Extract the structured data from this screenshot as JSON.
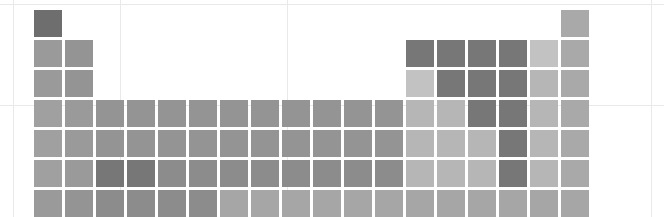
{
  "figure": {
    "type": "periodic-table-heatmap",
    "title": "",
    "background": "#ffffff",
    "cell_width": 28,
    "cell_height": 27,
    "cell_gap": 3,
    "grid_columns": 18,
    "grid_rows": 10,
    "origin": {
      "x": 34,
      "y": 10
    }
  },
  "guides": {
    "color": "#e9e9e9",
    "horizontal_y": [
      4,
      105
    ],
    "vertical_x": [
      13,
      120,
      287,
      651
    ]
  },
  "palette": {
    "darkest": "#6e6e6e",
    "dark": "#777777",
    "mid_dark": "#8c8c8c",
    "mid": "#999999",
    "mid_light": "#a3a3a3",
    "light": "#b4b4b4",
    "lightest": "#c4c4c4",
    "empty": "transparent"
  },
  "chart_data": {
    "type": "heatmap",
    "title": "",
    "xlabel": "",
    "ylabel": "",
    "grid": false,
    "legend": "none",
    "columns": 18,
    "rows": 10,
    "colorscale": [
      "#c4c4c4",
      "#b4b4b4",
      "#a3a3a3",
      "#999999",
      "#8c8c8c",
      "#777777",
      "#6e6e6e"
    ],
    "cells": [
      [
        {
          "symbol": "H",
          "color": "#6e6e6e"
        },
        null,
        null,
        null,
        null,
        null,
        null,
        null,
        null,
        null,
        null,
        null,
        null,
        null,
        null,
        null,
        null,
        {
          "symbol": "He",
          "color": "#a9a9a9"
        }
      ],
      [
        {
          "symbol": "Li",
          "color": "#9a9a9a"
        },
        {
          "symbol": "Be",
          "color": "#949494"
        },
        null,
        null,
        null,
        null,
        null,
        null,
        null,
        null,
        null,
        null,
        {
          "symbol": "B",
          "color": "#777777"
        },
        {
          "symbol": "C",
          "color": "#777777"
        },
        {
          "symbol": "N",
          "color": "#777777"
        },
        {
          "symbol": "O",
          "color": "#777777"
        },
        {
          "symbol": "F",
          "color": "#c2c2c2"
        },
        {
          "symbol": "Ne",
          "color": "#a9a9a9"
        }
      ],
      [
        {
          "symbol": "Na",
          "color": "#9a9a9a"
        },
        {
          "symbol": "Mg",
          "color": "#949494"
        },
        null,
        null,
        null,
        null,
        null,
        null,
        null,
        null,
        null,
        null,
        {
          "symbol": "Al",
          "color": "#c2c2c2"
        },
        {
          "symbol": "Si",
          "color": "#777777"
        },
        {
          "symbol": "P",
          "color": "#777777"
        },
        {
          "symbol": "S",
          "color": "#777777"
        },
        {
          "symbol": "Cl",
          "color": "#b6b6b6"
        },
        {
          "symbol": "Ar",
          "color": "#a9a9a9"
        }
      ],
      [
        {
          "symbol": "K",
          "color": "#a0a0a0"
        },
        {
          "symbol": "Ca",
          "color": "#9a9a9a"
        },
        {
          "symbol": "Sc",
          "color": "#949494"
        },
        {
          "symbol": "Ti",
          "color": "#949494"
        },
        {
          "symbol": "V",
          "color": "#949494"
        },
        {
          "symbol": "Cr",
          "color": "#949494"
        },
        {
          "symbol": "Mn",
          "color": "#949494"
        },
        {
          "symbol": "Fe",
          "color": "#949494"
        },
        {
          "symbol": "Co",
          "color": "#949494"
        },
        {
          "symbol": "Ni",
          "color": "#949494"
        },
        {
          "symbol": "Cu",
          "color": "#949494"
        },
        {
          "symbol": "Zn",
          "color": "#949494"
        },
        {
          "symbol": "Ga",
          "color": "#b6b6b6"
        },
        {
          "symbol": "Ge",
          "color": "#b6b6b6"
        },
        {
          "symbol": "As",
          "color": "#777777"
        },
        {
          "symbol": "Se",
          "color": "#777777"
        },
        {
          "symbol": "Br",
          "color": "#b6b6b6"
        },
        {
          "symbol": "Kr",
          "color": "#a9a9a9"
        }
      ],
      [
        {
          "symbol": "Rb",
          "color": "#a0a0a0"
        },
        {
          "symbol": "Sr",
          "color": "#9a9a9a"
        },
        {
          "symbol": "Y",
          "color": "#949494"
        },
        {
          "symbol": "Zr",
          "color": "#949494"
        },
        {
          "symbol": "Nb",
          "color": "#949494"
        },
        {
          "symbol": "Mo",
          "color": "#949494"
        },
        {
          "symbol": "Tc",
          "color": "#949494"
        },
        {
          "symbol": "Ru",
          "color": "#949494"
        },
        {
          "symbol": "Rh",
          "color": "#949494"
        },
        {
          "symbol": "Pd",
          "color": "#949494"
        },
        {
          "symbol": "Ag",
          "color": "#949494"
        },
        {
          "symbol": "Cd",
          "color": "#949494"
        },
        {
          "symbol": "In",
          "color": "#b6b6b6"
        },
        {
          "symbol": "Sn",
          "color": "#b6b6b6"
        },
        {
          "symbol": "Sb",
          "color": "#b6b6b6"
        },
        {
          "symbol": "Te",
          "color": "#777777"
        },
        {
          "symbol": "I",
          "color": "#b6b6b6"
        },
        {
          "symbol": "Xe",
          "color": "#a9a9a9"
        }
      ],
      [
        {
          "symbol": "Cs",
          "color": "#a0a0a0"
        },
        {
          "symbol": "Ba",
          "color": "#9a9a9a"
        },
        {
          "symbol": "La",
          "color": "#777777"
        },
        {
          "symbol": "Hf",
          "color": "#777777"
        },
        {
          "symbol": "Ta",
          "color": "#8c8c8c"
        },
        {
          "symbol": "W",
          "color": "#8c8c8c"
        },
        {
          "symbol": "Re",
          "color": "#8c8c8c"
        },
        {
          "symbol": "Os",
          "color": "#8c8c8c"
        },
        {
          "symbol": "Ir",
          "color": "#8c8c8c"
        },
        {
          "symbol": "Pt",
          "color": "#8c8c8c"
        },
        {
          "symbol": "Au",
          "color": "#8c8c8c"
        },
        {
          "symbol": "Hg",
          "color": "#8c8c8c"
        },
        {
          "symbol": "Tl",
          "color": "#b6b6b6"
        },
        {
          "symbol": "Pb",
          "color": "#b6b6b6"
        },
        {
          "symbol": "Bi",
          "color": "#b6b6b6"
        },
        {
          "symbol": "Po",
          "color": "#777777"
        },
        {
          "symbol": "At",
          "color": "#b6b6b6"
        },
        {
          "symbol": "Rn",
          "color": "#a9a9a9"
        }
      ],
      [
        {
          "symbol": "Fr",
          "color": "#9a9a9a"
        },
        {
          "symbol": "Ra",
          "color": "#949494"
        },
        {
          "symbol": "Ac",
          "color": "#8c8c8c"
        },
        {
          "symbol": "Rf",
          "color": "#8c8c8c"
        },
        {
          "symbol": "Db",
          "color": "#8c8c8c"
        },
        {
          "symbol": "Sg",
          "color": "#8c8c8c"
        },
        {
          "symbol": "Bh",
          "color": "#a6a6a6"
        },
        {
          "symbol": "Hs",
          "color": "#a6a6a6"
        },
        {
          "symbol": "Mt",
          "color": "#a6a6a6"
        },
        {
          "symbol": "Ds",
          "color": "#a6a6a6"
        },
        {
          "symbol": "Rg",
          "color": "#a6a6a6"
        },
        {
          "symbol": "Cn",
          "color": "#a6a6a6"
        },
        {
          "symbol": "Nh",
          "color": "#a6a6a6"
        },
        {
          "symbol": "Fl",
          "color": "#a6a6a6"
        },
        {
          "symbol": "Mc",
          "color": "#a6a6a6"
        },
        {
          "symbol": "Lv",
          "color": "#a6a6a6"
        },
        {
          "symbol": "Ts",
          "color": "#a6a6a6"
        },
        {
          "symbol": "Og",
          "color": "#a6a6a6"
        }
      ],
      [
        null,
        null,
        null,
        null,
        null,
        null,
        null,
        null,
        null,
        null,
        null,
        null,
        null,
        null,
        null,
        null,
        null,
        null
      ],
      [
        null,
        null,
        {
          "symbol": "Ce",
          "color": "#777777"
        },
        {
          "symbol": "Pr",
          "color": "#777777"
        },
        {
          "symbol": "Nd",
          "color": "#777777"
        },
        {
          "symbol": "Pm",
          "color": "#777777"
        },
        {
          "symbol": "Sm",
          "color": "#777777"
        },
        {
          "symbol": "Eu",
          "color": "#777777"
        },
        {
          "symbol": "Gd",
          "color": "#777777"
        },
        {
          "symbol": "Tb",
          "color": "#777777"
        },
        {
          "symbol": "Dy",
          "color": "#777777"
        },
        {
          "symbol": "Ho",
          "color": "#777777"
        },
        {
          "symbol": "Er",
          "color": "#777777"
        },
        {
          "symbol": "Tm",
          "color": "#777777"
        },
        {
          "symbol": "Yb",
          "color": "#777777"
        },
        {
          "symbol": "Lu",
          "color": "#777777"
        },
        null,
        null
      ],
      [
        null,
        null,
        {
          "symbol": "Th",
          "color": "#8c8c8c"
        },
        {
          "symbol": "Pa",
          "color": "#8c8c8c"
        },
        {
          "symbol": "U",
          "color": "#8c8c8c"
        },
        {
          "symbol": "Np",
          "color": "#8c8c8c"
        },
        {
          "symbol": "Pu",
          "color": "#b2b2b2"
        },
        {
          "symbol": "Am",
          "color": "#b2b2b2"
        },
        {
          "symbol": "Cm",
          "color": "#b2b2b2"
        },
        {
          "symbol": "Bk",
          "color": "#b2b2b2"
        },
        {
          "symbol": "Cf",
          "color": "#b2b2b2"
        },
        {
          "symbol": "Es",
          "color": "#b2b2b2"
        },
        {
          "symbol": "Fm",
          "color": "#b2b2b2"
        },
        {
          "symbol": "Md",
          "color": "#b2b2b2"
        },
        {
          "symbol": "No",
          "color": "#b2b2b2"
        },
        {
          "symbol": "Lr",
          "color": "#b2b2b2"
        },
        null,
        null
      ]
    ]
  }
}
